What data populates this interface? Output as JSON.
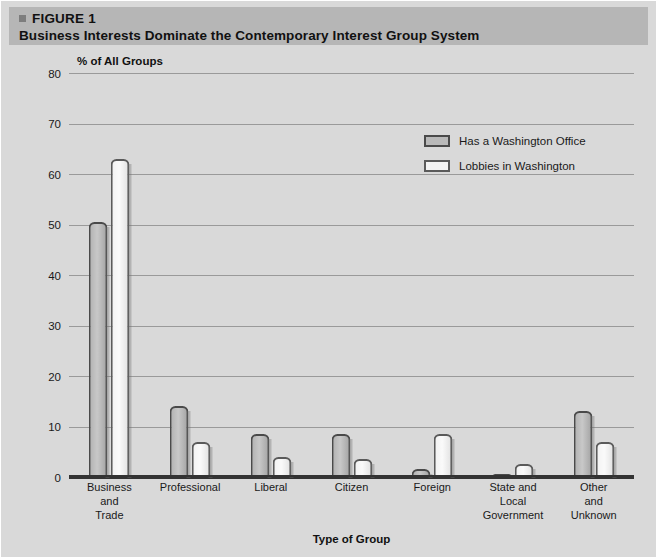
{
  "figure": {
    "marker_icon": "square-bullet-icon",
    "label": "FIGURE 1",
    "title": "Business Interests Dominate the Contemporary Interest Group System"
  },
  "colors": {
    "page_background": "#d9d9d9",
    "header_band": "#b6b6b6",
    "gridline": "#9a9a9a",
    "axis": "#333333",
    "series_has_office": "#b9b9b9",
    "series_lobbies": "#f3f3f3",
    "bar_outline": "#4a4a4a",
    "text": "#111111"
  },
  "chart_data": {
    "type": "bar",
    "title": "Business Interests Dominate the Contemporary Interest Group System",
    "subtitle": "FIGURE 1",
    "xlabel": "Type of Group",
    "ylabel": "% of All Groups",
    "ylim": [
      0,
      80
    ],
    "yticks": [
      0,
      10,
      20,
      30,
      40,
      50,
      60,
      70,
      80
    ],
    "ytick_labels": [
      "0",
      "10",
      "20",
      "30",
      "40",
      "50",
      "60",
      "70",
      "80"
    ],
    "grid": true,
    "legend_position": "upper-right-inside",
    "categories": [
      "Business and Trade",
      "Professional",
      "Liberal",
      "Citizen",
      "Foreign",
      "State and Local Government",
      "Other and Unknown"
    ],
    "category_lines": [
      [
        "Business",
        "and",
        "Trade"
      ],
      [
        "Professional"
      ],
      [
        "Liberal"
      ],
      [
        "Citizen"
      ],
      [
        "Foreign"
      ],
      [
        "State and",
        "Local",
        "Government"
      ],
      [
        "Other",
        "and",
        "Unknown"
      ]
    ],
    "series": [
      {
        "name": "Has a Washington Office",
        "values": [
          50.5,
          14,
          8.5,
          8.5,
          1.5,
          0.5,
          13
        ]
      },
      {
        "name": "Lobbies in Washington",
        "values": [
          63,
          7,
          4,
          3.5,
          8.5,
          2.5,
          7
        ]
      }
    ]
  },
  "legend": {
    "items": [
      {
        "label": "Has a Washington Office",
        "swatch": "dark"
      },
      {
        "label": "Lobbies in Washington",
        "swatch": "light"
      }
    ]
  }
}
